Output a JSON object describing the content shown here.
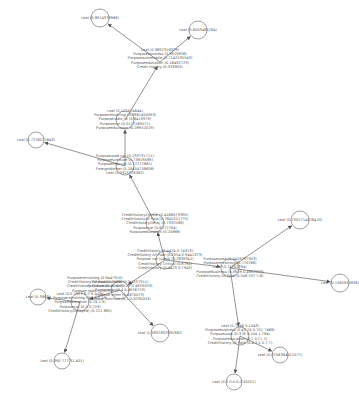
{
  "diagram": {
    "type": "tree",
    "edge_color": "#777777",
    "node_border_color": "#888888",
    "text_color": "#555555",
    "nodes": [
      {
        "id": "n1",
        "x": 100,
        "y": 18,
        "r": 9,
        "lines": [
          "Leaf (0.8974378966)"
        ],
        "label_dx": 0,
        "label_dy": 0
      },
      {
        "id": "n2",
        "x": 198,
        "y": 30,
        "r": 9,
        "lines": [
          "Leaf (0.6503485764)"
        ],
        "label_dx": 0,
        "label_dy": 0
      },
      {
        "id": "n3",
        "x": 160,
        "y": 62,
        "r": 0,
        "lines": [
          "Leaf (0.3697316329)",
          "Purposebusiness (0.3919926)",
          "Purposeautomobile (0.7142035543)",
          "Purposeeducation (0.16482723)",
          "Credit History (0.328805)"
        ],
        "label_dx": 0,
        "label_dy": -14
      },
      {
        "id": "n4",
        "x": 36,
        "y": 140,
        "r": 8,
        "lines": [
          "Leaf (0.7276571643)"
        ],
        "label_dx": 0,
        "label_dy": 0
      },
      {
        "id": "n5",
        "x": 125,
        "y": 120,
        "r": 9,
        "lines": [
          "Leaf (0.127574644)",
          "Purposeretraining (0.3861450093)",
          "Purposeradio_tv (0.8413979)",
          "Purposecar (0.0177169571)",
          "Purposeeducation (0.28952019)"
        ],
        "label_dx": 0,
        "label_dy": -11
      },
      {
        "id": "n6",
        "x": 125,
        "y": 166,
        "r": 9,
        "lines": [
          "Purposeused car (0.233731711)",
          "Purposefurniture (0.73819588)",
          "Purposenew car (0.77272681)",
          "ForeignWorker (0.18454758608)",
          "Leaf (0.0315378082)"
        ],
        "label_dx": 0,
        "label_dy": -12
      },
      {
        "id": "n7",
        "x": 155,
        "y": 223,
        "r": 9,
        "lines": [
          "CreditHistoryCritical (0.4168079395)",
          "CreditHistoryAll Paid (0.7845251775)",
          "CreditHistoryDelay (0.7332588)",
          "Purposecar (0.6277704)",
          "Purposeeducation (0.25888)"
        ],
        "label_dx": 0,
        "label_dy": -10
      },
      {
        "id": "n8",
        "x": 300,
        "y": 220,
        "r": 9,
        "lines": [
          "Leaf (0.7302714576420)"
        ],
        "label_dx": 0,
        "label_dy": 0
      },
      {
        "id": "n9",
        "x": 165,
        "y": 260,
        "r": 9,
        "lines": [
          "CreditHistory (0.4424 0.74313)",
          "CreditHistory All Paid (0.2354 0.9441373)",
          "Purpose car (used) (0.2839341)",
          "CreditHistory Critical (0.8795)",
          "CreditHistory (0.4423 0.7943)"
        ],
        "label_dx": 0,
        "label_dy": -11
      },
      {
        "id": "n10",
        "x": 230,
        "y": 268,
        "r": 9,
        "lines": [
          "Purposeused (0.4419787953)",
          "Purposeretraining (0.770768)",
          "Leaf (0.74252394)",
          "PurposeBusiness (0.3919 0.4982003)",
          "CreditHistory All Paid (0.248 197 7.6)"
        ],
        "label_dx": 0,
        "label_dy": -11
      },
      {
        "id": "n11",
        "x": 120,
        "y": 290,
        "r": 9,
        "lines": [
          "Purposebusiness (0.2 4237911)",
          "Purposeeducation (0.28 0.4829053)",
          "Purposecar (0.4 0.4976753)",
          "Purpose other (0.4870073)",
          "Purpose furniture (0.1 0.9230053)"
        ],
        "label_dx": 0,
        "label_dy": -10
      },
      {
        "id": "n12",
        "x": 95,
        "y": 283,
        "r": 0,
        "lines": [
          "Purposeretraining (0.9447910)",
          "CreditHistory All Paid (0.7521)",
          "CreditHistory Critical (0.47 0.8)",
          "Purpose radio tv (0.3 0.7)"
        ],
        "label_dx": 0,
        "label_dy": -7
      },
      {
        "id": "n13",
        "x": 80,
        "y": 302,
        "r": 9,
        "lines": [
          "Leaf (0.0 1917 6.2 9.1 79)",
          "Purposeretraining (0.1 8.5 19)",
          "Purposeeducation (0.74 1.9)",
          "Purposecar (0.3 0.729)",
          "CreditHistory(Delayed) (0.221 885)"
        ],
        "label_dx": 0,
        "label_dy": -10
      },
      {
        "id": "n14",
        "x": 38,
        "y": 297,
        "r": 8,
        "lines": [
          "Leaf (0.3863)"
        ],
        "label_dx": 0,
        "label_dy": 0
      },
      {
        "id": "n15",
        "x": 160,
        "y": 333,
        "r": 9,
        "lines": [
          "Leaf (1.5832832935362)"
        ],
        "label_dx": 0,
        "label_dy": 0
      },
      {
        "id": "n16",
        "x": 340,
        "y": 283,
        "r": 9,
        "lines": [
          "Leaf (0.1585952836)"
        ],
        "label_dx": 0,
        "label_dy": 0
      },
      {
        "id": "n17",
        "x": 62,
        "y": 361,
        "r": 8,
        "lines": [
          "Leaf (0.390 777 31 401)"
        ],
        "label_dx": 0,
        "label_dy": 0
      },
      {
        "id": "n18",
        "x": 240,
        "y": 336,
        "r": 9,
        "lines": [
          "Leaf (0.7546 0.1043)",
          "Purposebusiness (0.43 74 0.751 7468)",
          "Purposesuse (0.378 0.104 1.784)",
          "Purposeeducation (0.1 0.71 2)",
          "CreditHistory All Paid (0.4 2.5 0.7 7)"
        ],
        "label_dx": 0,
        "label_dy": -12
      },
      {
        "id": "n19",
        "x": 280,
        "y": 355,
        "r": 8,
        "lines": [
          "Leaf (0.3756384011077)"
        ],
        "label_dx": 0,
        "label_dy": 0
      },
      {
        "id": "n20",
        "x": 234,
        "y": 382,
        "r": 8,
        "lines": [
          "Leaf (0.3 0.0 0.0 50551)"
        ],
        "label_dx": 0,
        "label_dy": 0
      }
    ],
    "edges": [
      [
        "n3",
        "n1"
      ],
      [
        "n3",
        "n2"
      ],
      [
        "n5",
        "n3"
      ],
      [
        "n6",
        "n5"
      ],
      [
        "n6",
        "n4"
      ],
      [
        "n7",
        "n6"
      ],
      [
        "n9",
        "n7"
      ],
      [
        "n9",
        "n10"
      ],
      [
        "n10",
        "n8"
      ],
      [
        "n10",
        "n16"
      ],
      [
        "n9",
        "n11"
      ],
      [
        "n11",
        "n13"
      ],
      [
        "n13",
        "n14"
      ],
      [
        "n11",
        "n15"
      ],
      [
        "n13",
        "n17"
      ],
      [
        "n10",
        "n18"
      ],
      [
        "n18",
        "n19"
      ],
      [
        "n18",
        "n20"
      ]
    ]
  }
}
